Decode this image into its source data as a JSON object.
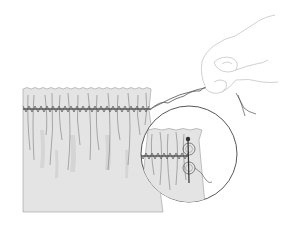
{
  "figure": {
    "title": "",
    "colors": {
      "background": "#ffffff",
      "fabric": "#e2e2e2",
      "fabric_shade": "#cfcfcf",
      "stitch": "#555555",
      "line": "#6a6a6a",
      "hand_line": "#b8b8b8",
      "pin": "#333333"
    },
    "elements": {
      "fabric_panel": "gathered fabric panel",
      "zigzag_stitch": "zigzag stitch over cord",
      "twisted_cord": "twisted cord held by hand",
      "hand": "hand pulling cord",
      "thread_end": "loose thread",
      "inset_circle": "magnified detail inset",
      "pin": "pin securing cord in figure-eight"
    }
  }
}
